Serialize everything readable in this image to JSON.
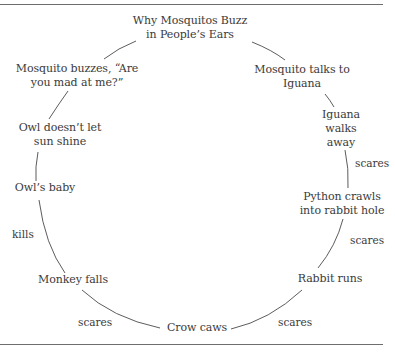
{
  "diagram": {
    "type": "cycle",
    "title": [
      "Why Mosquitos Buzz",
      "in People’s Ears"
    ],
    "nodes": [
      {
        "id": "title",
        "lines": [
          "Why Mosquitos Buzz",
          "in People’s Ears"
        ]
      },
      {
        "id": "mosquito-talks",
        "lines": [
          "Mosquito talks to",
          "Iguana"
        ]
      },
      {
        "id": "iguana-walks",
        "lines": [
          "Iguana",
          "walks",
          "away"
        ]
      },
      {
        "id": "python-crawls",
        "lines": [
          "Python crawls",
          "into rabbit hole"
        ]
      },
      {
        "id": "rabbit-runs",
        "lines": [
          "Rabbit runs"
        ]
      },
      {
        "id": "crow-caws",
        "lines": [
          "Crow caws"
        ]
      },
      {
        "id": "monkey-falls",
        "lines": [
          "Monkey falls"
        ]
      },
      {
        "id": "owls-baby",
        "lines": [
          "Owl’s baby"
        ]
      },
      {
        "id": "owl-sun",
        "lines": [
          "Owl doesn’t let",
          "sun shine"
        ]
      },
      {
        "id": "mosquito-buzzes",
        "lines": [
          "Mosquito buzzes, “Are",
          "you mad at me?”"
        ]
      }
    ],
    "edge_labels": {
      "iguana_to_python": "scares",
      "python_to_rabbit": "scares",
      "rabbit_to_crow": "scares",
      "crow_to_monkey": "scares",
      "monkey_to_owlbaby": "kills"
    },
    "colors": {
      "text": "#3a3a3a",
      "lines": "#4a4a4a",
      "rules": "#6e6e6e",
      "background": "#ffffff"
    }
  }
}
